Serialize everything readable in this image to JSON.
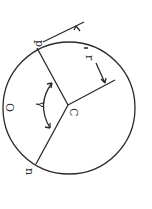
{
  "diagram": {
    "type": "circle-geometry",
    "orientation": "rotated 90 degrees",
    "labels": {
      "point_p": "p",
      "point_n": "n",
      "center": "C",
      "circle": "O",
      "angle": "γ",
      "radius": "r",
      "tangent": "t"
    },
    "colors": {
      "ink": "#2a2a2a",
      "background": "#ffffff"
    }
  }
}
